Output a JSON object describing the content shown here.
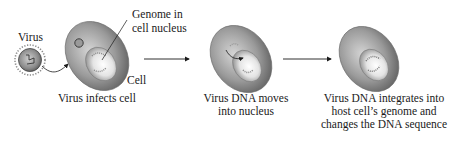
{
  "diagram": {
    "type": "process-flow",
    "steps": [
      {
        "id": "step-1",
        "caption": "Virus infects cell",
        "labels": {
          "virus": "Virus",
          "cell": "Cell",
          "genome_line1": "Genome in",
          "genome_line2": "cell nucleus"
        }
      },
      {
        "id": "step-2",
        "caption_line1": "Virus DNA moves",
        "caption_line2": "into nucleus"
      },
      {
        "id": "step-3",
        "caption_line1": "Virus DNA integrates into",
        "caption_line2": "host cell’s genome and",
        "caption_line3": "changes the DNA sequence"
      }
    ],
    "arrows": [
      {
        "from": "step-1",
        "to": "step-2"
      },
      {
        "from": "step-2",
        "to": "step-3"
      }
    ],
    "colors": {
      "cell_dark": "#6b6b6b",
      "cell_light": "#c8c8c8",
      "nucleus_light": "#f2f2f2",
      "text": "#1a1a1a"
    }
  }
}
